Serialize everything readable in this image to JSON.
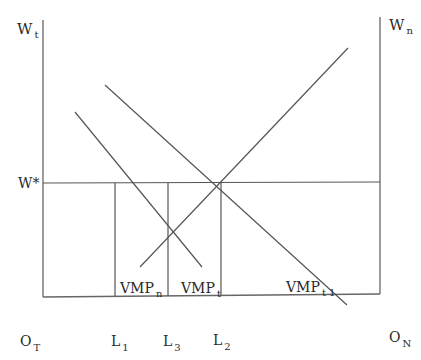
{
  "diagram": {
    "title": "",
    "axes": {
      "left_axis_label": {
        "main": "W",
        "sub": "t"
      },
      "right_axis_label": {
        "main": "W",
        "sub": "n"
      },
      "origin_left": {
        "main": "O",
        "sub": "T"
      },
      "origin_right": {
        "main": "O",
        "sub": "N"
      },
      "wage_label": "W*"
    },
    "x_markers": [
      {
        "id": "L1",
        "main": "L",
        "sub": "1"
      },
      {
        "id": "L3",
        "main": "L",
        "sub": "3"
      },
      {
        "id": "L2",
        "main": "L",
        "sub": "2"
      }
    ],
    "curves": [
      {
        "id": "VMP_n",
        "main": "VMP",
        "sub": "n",
        "slope": "upward (measured from right origin)"
      },
      {
        "id": "VMP_t",
        "main": "VMP",
        "sub": "t",
        "slope": "downward"
      },
      {
        "id": "VMP_t1",
        "main": "VMP",
        "sub": "t 1",
        "slope": "downward (shifted right)"
      }
    ],
    "colors": {
      "line": "#555555",
      "axis": "#666666",
      "text": "#2a2a2a",
      "background": "#ffffff"
    }
  }
}
